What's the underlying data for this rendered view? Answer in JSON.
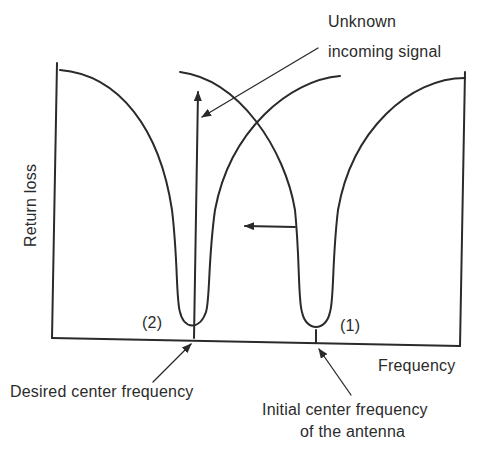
{
  "diagram": {
    "type": "frequency-response",
    "ylabel": "Return loss",
    "xlabel": "Frequency",
    "annotations": {
      "unknown_signal_line1": "Unknown",
      "unknown_signal_line2": "incoming signal",
      "desired_center": "Desired center frequency",
      "initial_center_line1": "Initial center frequency",
      "initial_center_line2": "of the antenna",
      "marker_2": "(2)",
      "marker_1": "(1)"
    },
    "curves": [
      {
        "name": "Curve (1) initial antenna response",
        "minimum_at": "Initial center frequency"
      },
      {
        "name": "Curve (2) tuned antenna response",
        "minimum_at": "Desired center frequency"
      }
    ],
    "shift_direction": "left",
    "colors": {
      "line": "#2a2a2a",
      "background": "#ffffff"
    }
  }
}
